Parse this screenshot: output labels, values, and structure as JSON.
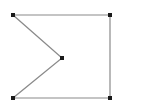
{
  "figure": {
    "kind": "polygon-line-drawing",
    "name": "notched-rectangle-polygon",
    "canvas": {
      "width": 148,
      "height": 111,
      "background_color": "#ffffff"
    },
    "style": {
      "edge_color": "#8a8a8a",
      "edge_width": 1.2,
      "vertex_color": "#1a1a1a",
      "vertex_size": 4,
      "closed": true
    },
    "vertices": [
      {
        "id": "v1",
        "label": "top-left",
        "x": 13,
        "y": 15
      },
      {
        "id": "v2",
        "label": "top-right",
        "x": 110,
        "y": 15
      },
      {
        "id": "v3",
        "label": "bottom-right",
        "x": 110,
        "y": 98
      },
      {
        "id": "v4",
        "label": "bottom-left",
        "x": 13,
        "y": 98
      },
      {
        "id": "v5",
        "label": "notch-apex",
        "x": 62,
        "y": 58
      }
    ],
    "edges": [
      {
        "id": "e1",
        "label": "top-edge",
        "from": "v1",
        "to": "v2",
        "orientation": "horizontal"
      },
      {
        "id": "e2",
        "label": "right-edge",
        "from": "v2",
        "to": "v3",
        "orientation": "vertical"
      },
      {
        "id": "e3",
        "label": "bottom-edge",
        "from": "v3",
        "to": "v4",
        "orientation": "horizontal"
      },
      {
        "id": "e4",
        "label": "lower-diagonal",
        "from": "v4",
        "to": "v5",
        "orientation": "diagonal"
      },
      {
        "id": "e5",
        "label": "upper-diagonal",
        "from": "v5",
        "to": "v1",
        "orientation": "diagonal"
      }
    ],
    "path_points": "13,15 110,15 110,98 13,98 62,58",
    "vertex_count": 5,
    "edge_count": 5
  }
}
